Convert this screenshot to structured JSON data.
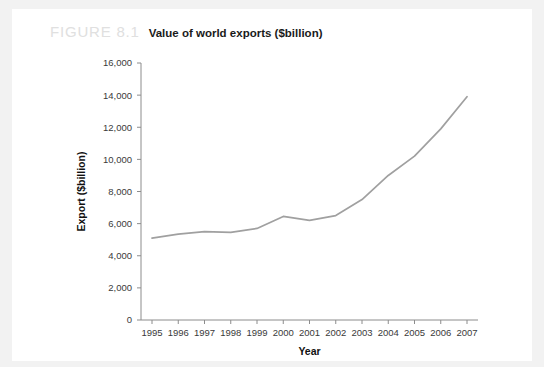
{
  "figure": {
    "number": "FIGURE 8.1",
    "title": "Value of world exports ($billion)"
  },
  "chart_data": {
    "type": "line",
    "title": "Value of world exports ($billion)",
    "xlabel": "Year",
    "ylabel": "Export ($billion)",
    "categories": [
      "1995",
      "1996",
      "1997",
      "1998",
      "1999",
      "2000",
      "2001",
      "2002",
      "2003",
      "2004",
      "2005",
      "2006",
      "2007"
    ],
    "values": [
      5100,
      5350,
      5500,
      5450,
      5700,
      6450,
      6200,
      6500,
      7500,
      9000,
      10200,
      11900,
      13900
    ],
    "ylim": [
      0,
      16000
    ],
    "ytick_labels": [
      "0",
      "2,000",
      "4,000",
      "6,000",
      "8,000",
      "10,000",
      "12,000",
      "14,000",
      "16,000"
    ],
    "ytick_values": [
      0,
      2000,
      4000,
      6000,
      8000,
      10000,
      12000,
      14000,
      16000
    ],
    "xtick_labels": [
      "1995",
      "1996",
      "1997",
      "1998",
      "1999",
      "2000",
      "2001",
      "2002",
      "2003",
      "2004",
      "2005",
      "2006",
      "2007"
    ],
    "grid": false,
    "legend": false,
    "series_color": "#a0a0a0"
  },
  "axes": {
    "x_title": "Year",
    "y_title": "Export ($billion)"
  }
}
